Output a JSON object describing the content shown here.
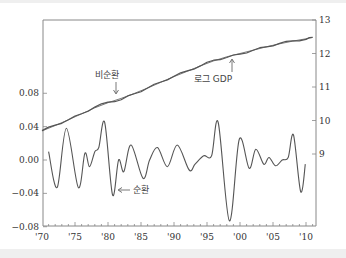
{
  "chart_data": {
    "type": "line",
    "title": "",
    "xlabel": "",
    "ylabel_left": "",
    "ylabel_right": "",
    "x_ticks": [
      "'70",
      "'75",
      "'80",
      "'85",
      "'90",
      "'95",
      "'00",
      "'05",
      "'10"
    ],
    "x_range": [
      1970,
      2011
    ],
    "left_axis": {
      "ticks": [
        "0.08",
        "0.04",
        "0.00",
        "−0.04",
        "−0.08"
      ],
      "range": [
        -0.08,
        0.08
      ]
    },
    "right_axis": {
      "ticks": [
        "13",
        "12",
        "11",
        "10",
        "9"
      ],
      "range": [
        8.0,
        13
      ]
    },
    "grid": false,
    "annotations": [
      {
        "text": "비순환",
        "points_to": "trend (non-cyclical component)",
        "x": 1980,
        "y_right": 10.6
      },
      {
        "text": "로그 GDP",
        "points_to": "log GDP",
        "x": 1998,
        "y_right": 11.8
      },
      {
        "text": "순환",
        "points_to": "cyclical component",
        "x": 1980.8,
        "y_left": -0.042
      }
    ],
    "series": [
      {
        "name": "로그 GDP",
        "axis": "right",
        "x": [
          1970,
          1972,
          1974,
          1976,
          1978,
          1980,
          1982,
          1984,
          1986,
          1988,
          1990,
          1992,
          1994,
          1996,
          1998,
          2000,
          2002,
          2004,
          2006,
          2008,
          2010,
          2011
        ],
        "values": [
          9.7,
          9.86,
          10.02,
          10.2,
          10.4,
          10.55,
          10.62,
          10.8,
          10.97,
          11.15,
          11.32,
          11.48,
          11.63,
          11.8,
          11.88,
          11.98,
          12.1,
          12.2,
          12.3,
          12.38,
          12.42,
          12.48
        ]
      },
      {
        "name": "비순환",
        "axis": "right",
        "x": [
          1970,
          1972,
          1974,
          1976,
          1978,
          1980,
          1982,
          1984,
          1986,
          1988,
          1990,
          1992,
          1994,
          1996,
          1998,
          2000,
          2002,
          2004,
          2006,
          2008,
          2010,
          2011
        ],
        "values": [
          9.69,
          9.85,
          10.02,
          10.2,
          10.38,
          10.53,
          10.66,
          10.81,
          10.97,
          11.14,
          11.31,
          11.47,
          11.63,
          11.78,
          11.9,
          12.0,
          12.1,
          12.2,
          12.29,
          12.37,
          12.44,
          12.48
        ]
      },
      {
        "name": "순환",
        "axis": "left",
        "x": [
          1971,
          1972.3,
          1973.7,
          1975.5,
          1976.5,
          1977.2,
          1978,
          1978.6,
          1979.5,
          1980.7,
          1981.6,
          1982.4,
          1983.5,
          1985.3,
          1986.3,
          1987.5,
          1989,
          1990.5,
          1992.3,
          1993.2,
          1994.5,
          1995.7,
          1996.7,
          1998.4,
          1999.9,
          2001.4,
          2002.4,
          2003.6,
          2004.4,
          2005.4,
          2006.4,
          2007.3,
          2008.1,
          2009.2,
          2009.9
        ],
        "values": [
          0.01,
          -0.033,
          0.038,
          -0.033,
          0.008,
          -0.008,
          0.01,
          0.015,
          0.045,
          -0.042,
          0.0,
          -0.014,
          0.018,
          -0.022,
          0.0,
          0.015,
          -0.008,
          0.018,
          -0.012,
          -0.005,
          0.005,
          0.005,
          0.045,
          -0.073,
          0.025,
          -0.01,
          0.013,
          -0.005,
          0.003,
          -0.007,
          0.0,
          0.003,
          0.03,
          -0.038,
          -0.005
        ]
      }
    ]
  },
  "colors": {
    "line": "#555555",
    "axis": "#888888",
    "text": "#333333",
    "band": "#efefef"
  }
}
